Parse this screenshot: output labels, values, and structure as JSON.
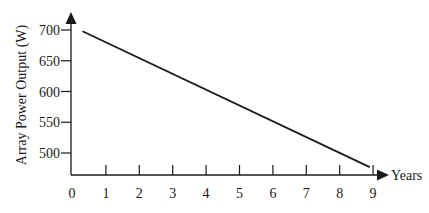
{
  "chart_data": {
    "type": "line",
    "title": "",
    "xlabel": "Years",
    "ylabel": "Array Power Output (W)",
    "x_ticks": [
      0,
      1,
      2,
      3,
      4,
      5,
      6,
      7,
      8,
      9
    ],
    "y_ticks": [
      500,
      550,
      600,
      650,
      700
    ],
    "xlim": [
      0,
      9
    ],
    "ylim": [
      465,
      700
    ],
    "grid": false,
    "legend": null,
    "series": [
      {
        "name": "Array Power Output",
        "x": [
          0.3,
          8.9
        ],
        "y": [
          698,
          477
        ]
      }
    ],
    "colors": {
      "line": "#1a1a1a",
      "axis": "#1a1a1a"
    }
  }
}
